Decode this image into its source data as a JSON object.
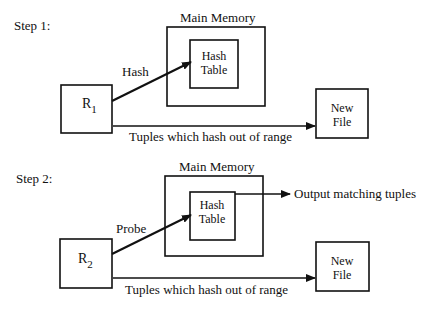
{
  "steps": [
    {
      "label": "Step 1:",
      "main_memory_label": "Main Memory",
      "hash_table_line1": "Hash",
      "hash_table_line2": "Table",
      "relation_base": "R",
      "relation_sub": "1",
      "arrow_label": "Hash",
      "new_file_line1": "New",
      "new_file_line2": "File",
      "range_label": "Tuples which hash out of range"
    },
    {
      "label": "Step 2:",
      "main_memory_label": "Main Memory",
      "hash_table_line1": "Hash",
      "hash_table_line2": "Table",
      "relation_base": "R",
      "relation_sub": "2",
      "arrow_label": "Probe",
      "output_label": "Output matching tuples",
      "new_file_line1": "New",
      "new_file_line2": "File",
      "range_label": "Tuples which hash out of range"
    }
  ],
  "colors": {
    "stroke": "#111111",
    "background": "#ffffff"
  }
}
